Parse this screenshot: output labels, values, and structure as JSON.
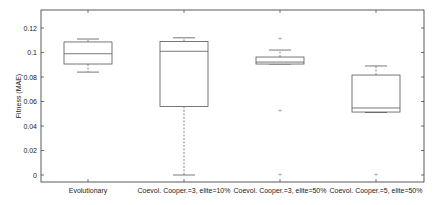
{
  "chart_data": {
    "type": "box",
    "title": "",
    "xlabel": "",
    "ylabel": "Fitness (MAE)",
    "ylim": [
      -0.005,
      0.135
    ],
    "yticks": [
      0,
      0.02,
      0.04,
      0.06,
      0.08,
      0.1,
      0.12
    ],
    "ytick_labels": [
      "0",
      "0.02",
      "0.04",
      "0.06",
      "0.08",
      "0.1",
      "0.12"
    ],
    "grid": false,
    "legend": null,
    "categories": [
      "Evolutionary",
      "Coevol. Cooper.=3, elite=10%",
      "Coevol. Cooper.=3, elite=50%",
      "Coevol. Cooper.=5, elite=50%"
    ],
    "boxes": [
      {
        "label": "Evolutionary",
        "whisker_low": 0.084,
        "q1": 0.0906,
        "median": 0.099,
        "q3": 0.1086,
        "whisker_high": 0.111,
        "outliers": []
      },
      {
        "label": "Coevol. Cooper.=3, elite=10%",
        "whisker_low": 0.0,
        "q1": 0.056,
        "median": 0.101,
        "q3": 0.109,
        "whisker_high": 0.112,
        "outliers": []
      },
      {
        "label": "Coevol. Cooper.=3, elite=50%",
        "whisker_low": 0.0906,
        "q1": 0.0906,
        "median": 0.0922,
        "q3": 0.0963,
        "whisker_high": 0.102,
        "outliers": [
          0.112,
          0.053,
          0.001
        ]
      },
      {
        "label": "Coevol. Cooper.=5, elite=50%",
        "whisker_low": 0.051,
        "q1": 0.0514,
        "median": 0.0547,
        "q3": 0.0816,
        "whisker_high": 0.089,
        "outliers": [
          0.001
        ]
      }
    ]
  },
  "colors": {
    "axis": "#333333",
    "box": "#555555",
    "whisker": "#555555",
    "outlier": "#777777"
  }
}
